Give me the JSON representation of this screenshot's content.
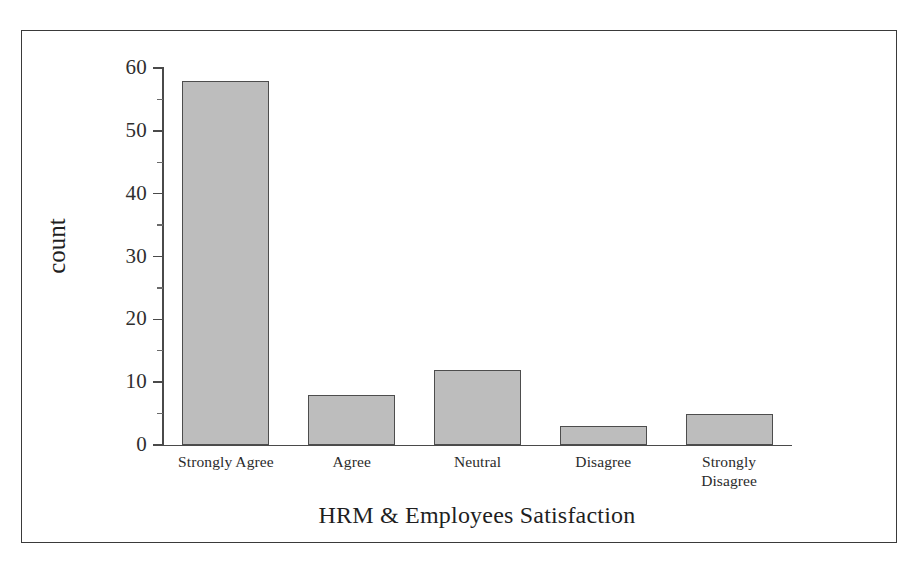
{
  "figure": {
    "frame_border_color": "#3a3a3a",
    "background_color": "#ffffff"
  },
  "chart_data": {
    "type": "bar",
    "title": "",
    "categories": [
      "Strongly Agree",
      "Agree",
      "Neutral",
      "Disagree",
      "Strongly Disagree"
    ],
    "values": [
      58,
      8,
      12,
      3,
      5
    ],
    "xlabel": "HRM & Employees Satisfaction",
    "ylabel": "count",
    "ylim": [
      0,
      60
    ],
    "yticks": [
      0,
      10,
      20,
      30,
      40,
      50,
      60
    ],
    "ytick_labels": [
      "0",
      "10",
      "20",
      "30",
      "40",
      "50",
      "60"
    ],
    "grid": false,
    "legend": false,
    "bar_fill_color": "#bdbdbd",
    "bar_edge_color": "#4d4d4d",
    "axis_color": "#4a4a4a"
  },
  "axis": {
    "y_title": "count",
    "x_title": "HRM & Employees Satisfaction"
  }
}
